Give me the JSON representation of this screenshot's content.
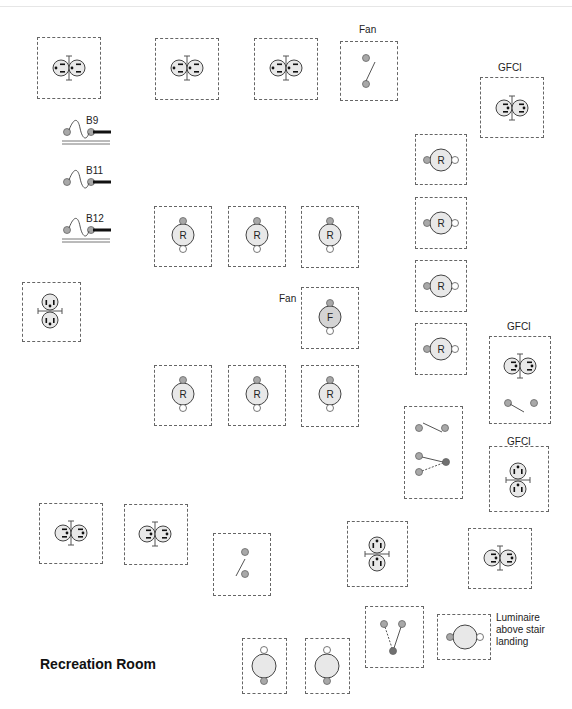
{
  "title": "Recreation Room",
  "colors": {
    "box_border": "#666666",
    "device_fill": "#e8e8e8",
    "terminal_fill": "#a8a8a8",
    "terminal_dark": "#707070",
    "line": "#555555"
  },
  "labels": [
    {
      "id": "fan-label-top",
      "text": "Fan",
      "x": 359,
      "y": 24
    },
    {
      "id": "gfci-label-1",
      "text": "GFCI",
      "x": 498,
      "y": 62
    },
    {
      "id": "fan-label-mid",
      "text": "Fan",
      "x": 279,
      "y": 293
    },
    {
      "id": "gfci-label-2",
      "text": "GFCI",
      "x": 507,
      "y": 321
    },
    {
      "id": "gfci-label-3",
      "text": "GFCI",
      "x": 507,
      "y": 436
    },
    {
      "id": "luminaire-label",
      "text": "Luminaire\nabove stair\nlanding",
      "x": 496,
      "y": 612
    }
  ],
  "circuits": [
    {
      "id": "B9",
      "label": "B9",
      "x": 62,
      "y": 120,
      "double_line": true
    },
    {
      "id": "B11",
      "label": "B11",
      "x": 62,
      "y": 170,
      "double_line": false
    },
    {
      "id": "B12",
      "label": "B12",
      "x": 62,
      "y": 218,
      "double_line": true
    }
  ],
  "devices": [
    {
      "id": "duplex-1",
      "type": "duplex-h",
      "box": [
        37,
        37,
        64,
        62
      ],
      "cx": 69,
      "cy": 68
    },
    {
      "id": "duplex-2",
      "type": "duplex-h",
      "box": [
        155,
        38,
        64,
        62
      ],
      "cx": 187,
      "cy": 68
    },
    {
      "id": "duplex-3",
      "type": "duplex-h",
      "box": [
        254,
        38,
        64,
        62
      ],
      "cx": 286,
      "cy": 68
    },
    {
      "id": "fan-switch",
      "type": "switch-single",
      "box": [
        340,
        41,
        58,
        60
      ],
      "cx": 369,
      "cy": 71
    },
    {
      "id": "gfci-duplex-1",
      "type": "duplex-h-rev",
      "box": [
        480,
        77,
        64,
        61
      ],
      "cx": 512,
      "cy": 108
    },
    {
      "id": "recessed-r1",
      "type": "recessed-h",
      "box": [
        415,
        134,
        52,
        51
      ],
      "cx": 441,
      "cy": 160,
      "text": "R"
    },
    {
      "id": "recessed-r2",
      "type": "recessed-h",
      "box": [
        415,
        197,
        52,
        52
      ],
      "cx": 441,
      "cy": 223,
      "text": "R"
    },
    {
      "id": "recessed-r3",
      "type": "recessed-h",
      "box": [
        415,
        260,
        52,
        52
      ],
      "cx": 441,
      "cy": 286,
      "text": "R"
    },
    {
      "id": "recessed-r4",
      "type": "recessed-h",
      "box": [
        415,
        323,
        52,
        52
      ],
      "cx": 441,
      "cy": 349,
      "text": "R"
    },
    {
      "id": "recessed-c1",
      "type": "recessed-v",
      "box": [
        154,
        206,
        58,
        61
      ],
      "cx": 183,
      "cy": 235,
      "text": "R"
    },
    {
      "id": "recessed-c2",
      "type": "recessed-v",
      "box": [
        228,
        206,
        58,
        61
      ],
      "cx": 257,
      "cy": 235,
      "text": "R"
    },
    {
      "id": "recessed-c3",
      "type": "recessed-v",
      "box": [
        301,
        206,
        58,
        62
      ],
      "cx": 330,
      "cy": 235,
      "text": "R"
    },
    {
      "id": "ceiling-fan",
      "type": "fan",
      "box": [
        301,
        287,
        58,
        62
      ],
      "cx": 330,
      "cy": 317,
      "text": "F"
    },
    {
      "id": "duplex-vertical-left",
      "type": "duplex-v",
      "box": [
        22,
        282,
        59,
        60
      ],
      "cx": 50,
      "cy": 311
    },
    {
      "id": "recessed-c4",
      "type": "recessed-v",
      "box": [
        154,
        365,
        58,
        61
      ],
      "cx": 183,
      "cy": 394,
      "text": "R"
    },
    {
      "id": "recessed-c5",
      "type": "recessed-v",
      "box": [
        228,
        365,
        58,
        61
      ],
      "cx": 257,
      "cy": 394,
      "text": "R"
    },
    {
      "id": "recessed-c6",
      "type": "recessed-v",
      "box": [
        301,
        365,
        58,
        62
      ],
      "cx": 330,
      "cy": 394,
      "text": "R"
    },
    {
      "id": "gfci-combo",
      "type": "gfci-combo",
      "box": [
        489,
        336,
        62,
        88
      ],
      "cx": 520,
      "cy": 366
    },
    {
      "id": "switch-bank",
      "type": "switch-bank",
      "box": [
        404,
        406,
        59,
        93
      ],
      "cx": 433,
      "cy": 452
    },
    {
      "id": "gfci-duplex-vertical",
      "type": "duplex-v-dot",
      "box": [
        489,
        446,
        60,
        66
      ],
      "cx": 518,
      "cy": 480
    },
    {
      "id": "duplex-4",
      "type": "duplex-h-rev",
      "box": [
        39,
        503,
        64,
        61
      ],
      "cx": 71,
      "cy": 533
    },
    {
      "id": "duplex-5",
      "type": "duplex-h-rev",
      "box": [
        124,
        504,
        64,
        61
      ],
      "cx": 155,
      "cy": 534
    },
    {
      "id": "stair-switch",
      "type": "switch-single-low",
      "box": [
        213,
        533,
        58,
        63
      ],
      "cx": 242,
      "cy": 563
    },
    {
      "id": "duplex-vertical-mid",
      "type": "duplex-v-dot",
      "box": [
        347,
        521,
        61,
        66
      ],
      "cx": 377,
      "cy": 554
    },
    {
      "id": "duplex-6",
      "type": "duplex-h-rev",
      "box": [
        468,
        528,
        64,
        61
      ],
      "cx": 500,
      "cy": 558
    },
    {
      "id": "threeway-switch",
      "type": "threeway",
      "box": [
        365,
        606,
        59,
        62
      ],
      "cx": 394,
      "cy": 636
    },
    {
      "id": "stair-luminaire",
      "type": "luminaire-h",
      "box": [
        437,
        614,
        54,
        46
      ],
      "cx": 464,
      "cy": 637
    },
    {
      "id": "luminaire-1",
      "type": "luminaire-v",
      "box": [
        242,
        638,
        45,
        56
      ],
      "cx": 264,
      "cy": 666
    },
    {
      "id": "luminaire-2",
      "type": "luminaire-v",
      "box": [
        305,
        638,
        45,
        56
      ],
      "cx": 327,
      "cy": 666
    }
  ]
}
